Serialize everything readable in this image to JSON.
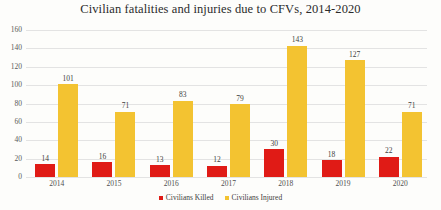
{
  "chart_data": {
    "type": "bar",
    "title": "Civilian fatalities and injuries due to CFVs, 2014-2020",
    "xlabel": "",
    "ylabel": "",
    "categories": [
      "2014",
      "2015",
      "2016",
      "2017",
      "2018",
      "2019",
      "2020"
    ],
    "series": [
      {
        "name": "Civilians Killed",
        "color": "#e01b16",
        "values": [
          14,
          16,
          13,
          12,
          30,
          18,
          22
        ]
      },
      {
        "name": "Civilians Injured",
        "color": "#f3c331",
        "values": [
          101,
          71,
          83,
          79,
          143,
          127,
          71
        ]
      }
    ],
    "ylim": [
      0,
      160
    ],
    "yticks": [
      0,
      20,
      40,
      60,
      80,
      100,
      120,
      140,
      160
    ],
    "grid": true,
    "data_labels": true,
    "legend_position": "bottom"
  },
  "legend": {
    "items": [
      {
        "label": "Civilians Killed",
        "color": "#e01b16"
      },
      {
        "label": "Civilians Injured",
        "color": "#f3c331"
      }
    ]
  }
}
